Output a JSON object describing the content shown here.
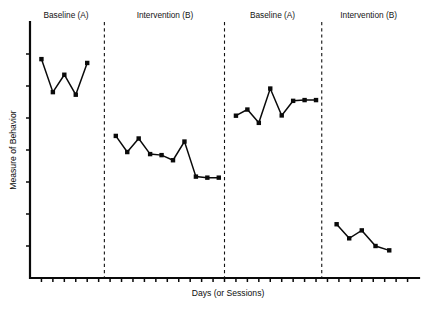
{
  "chart_data": {
    "type": "line",
    "title": "",
    "subtitle": "",
    "xlabel": "Days (or Sessions)",
    "ylabel": "Measure of Behavior",
    "design": "ABAB reversal (withdrawal) single-case design",
    "xlim": [
      0,
      34
    ],
    "ylim": [
      0,
      10
    ],
    "grid": false,
    "legend": "none",
    "x_tick_labels": [],
    "y_tick_labels": [],
    "x_tick_count": 33,
    "y_tick_count": 7,
    "phase_labels": [
      "Baseline (A)",
      "Intervention (B)",
      "Baseline (A)",
      "Intervention (B)"
    ],
    "phase_divider_x": [
      6.5,
      17.0,
      25.5
    ],
    "series": [
      {
        "name": "Measure of Behavior",
        "marker": "square",
        "x": [
          1,
          2,
          3,
          4,
          5,
          7.5,
          8.5,
          9.5,
          10.5,
          11.5,
          12.5,
          13.5,
          14.5,
          15.5,
          16.5,
          18.0,
          19.0,
          20.0,
          21.0,
          22.0,
          23.0,
          24.0,
          25.0,
          26.8,
          27.9,
          29.0,
          30.2,
          31.4
        ],
        "values": [
          8.55,
          7.26,
          7.94,
          7.16,
          8.4,
          5.55,
          4.92,
          5.45,
          4.84,
          4.8,
          4.6,
          5.33,
          3.96,
          3.92,
          3.92,
          6.34,
          6.58,
          6.06,
          7.4,
          6.35,
          6.92,
          6.95,
          6.95,
          2.1,
          1.55,
          1.86,
          1.25,
          1.08
        ],
        "phase_point_counts": [
          5,
          10,
          8,
          5
        ]
      }
    ],
    "phases": [
      {
        "label": "Baseline (A)",
        "label_x": 3.15,
        "values": [
          8.55,
          7.26,
          7.94,
          7.16,
          8.4
        ]
      },
      {
        "label": "Intervention (B)",
        "label_x": 11.8,
        "values": [
          5.55,
          4.92,
          5.45,
          4.84,
          4.8,
          4.6,
          5.33,
          3.96,
          3.92,
          3.92
        ]
      },
      {
        "label": "Baseline (A)",
        "label_x": 21.2,
        "values": [
          6.34,
          6.58,
          6.06,
          7.4,
          6.35,
          6.92,
          6.95,
          6.95
        ]
      },
      {
        "label": "Intervention (B)",
        "label_x": 29.6,
        "values": [
          2.1,
          1.55,
          1.86,
          1.25,
          1.08
        ]
      }
    ],
    "colors": {
      "line": "#0a0a0a",
      "marker": "#0a0a0a",
      "axis": "#0a0a0a",
      "divider": "#111111",
      "background": "#ffffff",
      "text": "#141414"
    }
  }
}
